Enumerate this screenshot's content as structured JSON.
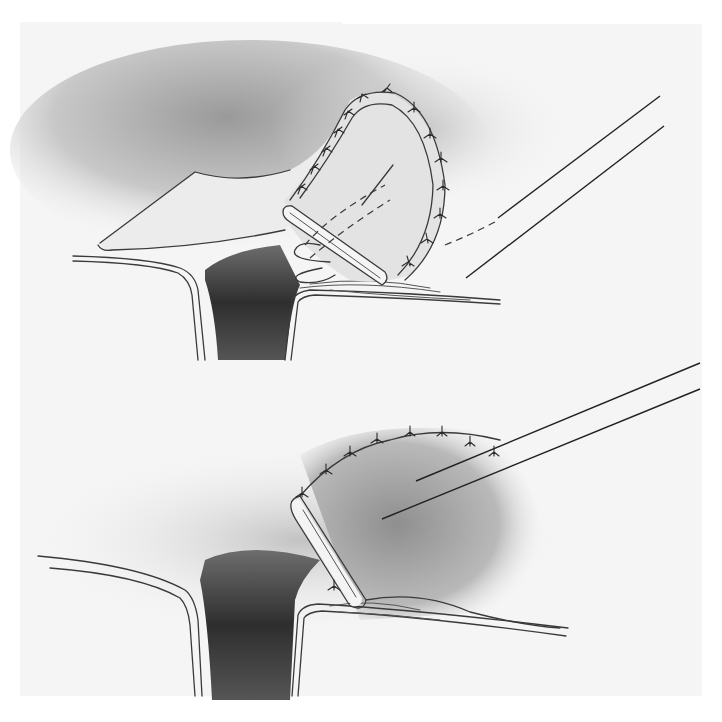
{
  "figure": {
    "background_color": "#ffffff",
    "paper_tone": "#f4f4f4",
    "shadow_dark": "#2e2e2e",
    "panels": [
      {
        "id": "top",
        "label": "",
        "elements": [
          "skin-flap",
          "sutured-rolled-flap",
          "cavity",
          "retractor-wires",
          "dashed-suture-path"
        ]
      },
      {
        "id": "bottom",
        "label": "",
        "elements": [
          "folded-flap-edge",
          "sutured-dome",
          "cavity",
          "retractor-wires"
        ]
      }
    ]
  }
}
